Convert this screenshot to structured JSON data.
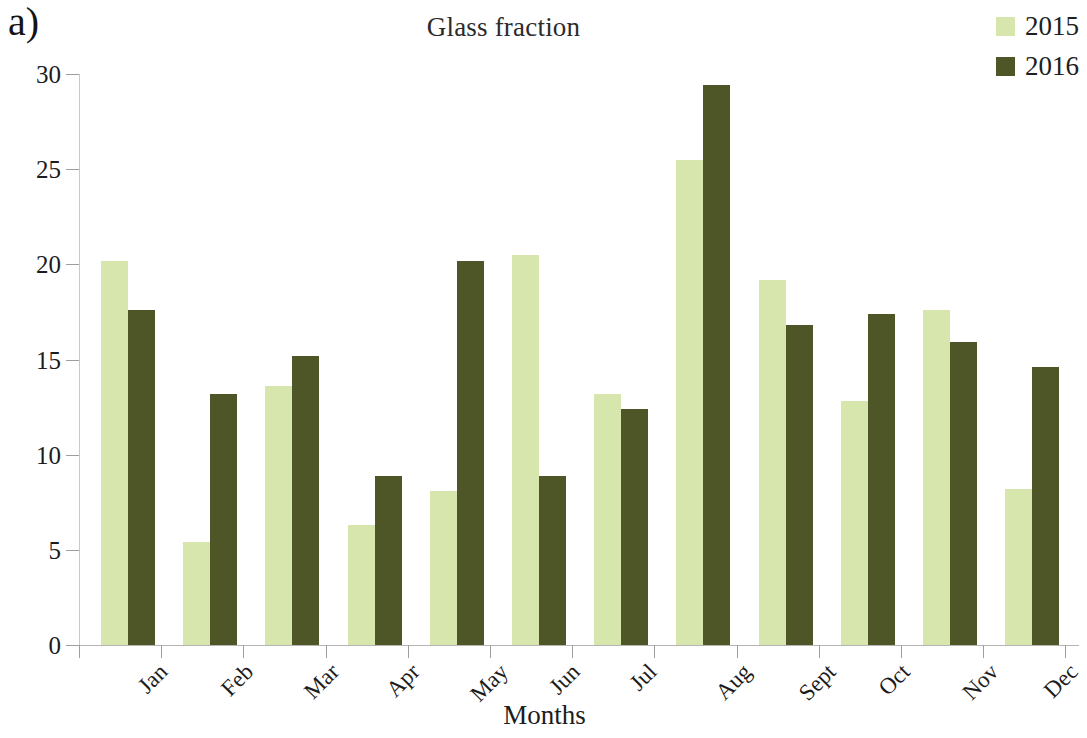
{
  "panel": {
    "label": "a)"
  },
  "chart_data": {
    "type": "bar",
    "title": "Glass fraction",
    "xlabel": "Months",
    "ylabel": "Tonnes",
    "ylim": [
      0,
      30
    ],
    "yticks": [
      0,
      5,
      10,
      15,
      20,
      25,
      30
    ],
    "ytick_labels": [
      "0",
      "5",
      "10",
      "15",
      "20",
      "25",
      "30"
    ],
    "grid": false,
    "legend_position": "top-right",
    "categories": [
      "Jan",
      "Feb",
      "Mar",
      "Apr",
      "May",
      "Jun",
      "Jul",
      "Aug",
      "Sept",
      "Oct",
      "Nov",
      "Dec"
    ],
    "series": [
      {
        "name": "2015",
        "color": "#d6e6ad",
        "values": [
          20.2,
          5.4,
          13.6,
          6.3,
          8.1,
          20.5,
          13.2,
          25.5,
          19.2,
          12.8,
          17.6,
          8.2
        ]
      },
      {
        "name": "2016",
        "color": "#4e5627",
        "values": [
          17.6,
          13.2,
          15.2,
          8.9,
          20.2,
          8.9,
          12.4,
          29.4,
          16.8,
          17.4,
          15.9,
          14.6
        ]
      }
    ]
  },
  "legend": {
    "items": [
      {
        "label": "2015",
        "color": "#d6e6ad"
      },
      {
        "label": "2016",
        "color": "#4e5627"
      }
    ]
  }
}
